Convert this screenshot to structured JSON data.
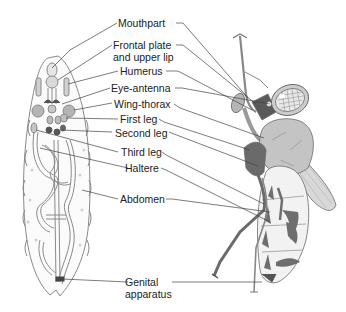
{
  "diagram": {
    "type": "labeled anatomical illustration",
    "panels": [
      "larva-cross-section",
      "adult-fly"
    ],
    "labels": [
      {
        "id": "mouthpart",
        "text": "Mouthpart"
      },
      {
        "id": "frontal-plate",
        "text_line1": "Frontal plate",
        "text_line2": "and upper lip"
      },
      {
        "id": "humerus",
        "text": "Humerus"
      },
      {
        "id": "eye-antenna",
        "text": "Eye-antenna"
      },
      {
        "id": "wing-thorax",
        "text": "Wing-thorax"
      },
      {
        "id": "first-leg",
        "text": "First leg"
      },
      {
        "id": "second-leg",
        "text": "Second leg"
      },
      {
        "id": "third-leg",
        "text": "Third leg"
      },
      {
        "id": "haltere",
        "text": "Haltere"
      },
      {
        "id": "abdomen",
        "text": "Abdomen"
      },
      {
        "id": "genital-apparatus",
        "text_line1": "Genital",
        "text_line2": "apparatus"
      }
    ],
    "colors": {
      "line": "#444444",
      "larva_outline": "#8a8a8a",
      "fly_light": "#c4c4c4",
      "fly_dark": "#6e6e6e",
      "disc_fill": "#b5b5b5"
    }
  }
}
